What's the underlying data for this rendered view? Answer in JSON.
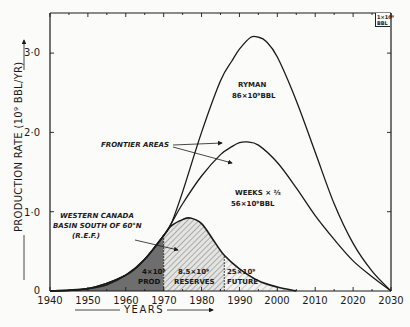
{
  "chart_data": {
    "type": "line",
    "title": "",
    "xlabel": "YEARS",
    "ylabel": "PRODUCTION RATE (10^9 BBL/YR)",
    "xlim": [
      1940,
      2030
    ],
    "ylim": [
      0,
      3.5
    ],
    "grid": false,
    "x_ticks": [
      "1940",
      "1950",
      "1960",
      "1970",
      "1980",
      "1990",
      "2000",
      "2010",
      "2020",
      "2030"
    ],
    "y_ticks": [
      "0",
      "1·0",
      "2·0",
      "3·0"
    ],
    "unit_box": "1×10⁹ BBL",
    "series": [
      {
        "name": "Ryman 86×10⁹ BBL",
        "x": [
          1940,
          1950,
          1960,
          1965,
          1970,
          1972,
          1975,
          1980,
          1985,
          1988,
          1990,
          1993,
          1995,
          1997,
          2000,
          2005,
          2010,
          2015,
          2020,
          2025,
          2030
        ],
        "values": [
          0.0,
          0.03,
          0.2,
          0.4,
          0.7,
          0.85,
          1.25,
          2.0,
          2.65,
          2.9,
          3.05,
          3.2,
          3.2,
          3.15,
          2.95,
          2.4,
          1.75,
          1.1,
          0.6,
          0.25,
          0.0
        ]
      },
      {
        "name": "Weeks × 2/3 56×10⁹ BBL",
        "x": [
          1940,
          1950,
          1960,
          1965,
          1970,
          1972,
          1975,
          1980,
          1985,
          1988,
          1990,
          1992,
          1995,
          2000,
          2005,
          2010,
          2015,
          2020,
          2025,
          2030
        ],
        "values": [
          0.0,
          0.03,
          0.2,
          0.4,
          0.7,
          0.85,
          1.1,
          1.45,
          1.72,
          1.82,
          1.87,
          1.88,
          1.84,
          1.62,
          1.3,
          0.95,
          0.65,
          0.38,
          0.18,
          0.0
        ]
      },
      {
        "name": "Western Canada Basin South of 60°N (R.E.F.)",
        "x": [
          1940,
          1950,
          1955,
          1960,
          1965,
          1970,
          1972,
          1975,
          1977,
          1980,
          1983,
          1986,
          1990,
          1995,
          2000,
          2005
        ],
        "values": [
          0.0,
          0.03,
          0.08,
          0.2,
          0.4,
          0.7,
          0.82,
          0.9,
          0.92,
          0.85,
          0.65,
          0.45,
          0.28,
          0.13,
          0.05,
          0.0
        ]
      }
    ],
    "regions": [
      {
        "label": "4×10⁹ PROD",
        "from": 1940,
        "to": 1970,
        "fill": "dark-grey"
      },
      {
        "label": "8.5×10⁹ RESERVES",
        "from": 1970,
        "to": 1986,
        "fill": "hatched"
      },
      {
        "label": "25×10⁹ FUTURE",
        "from": 1986,
        "to": 2005,
        "fill": "light-hatched"
      }
    ],
    "annotations": [
      {
        "text": "RYMAN",
        "sub": "86×10⁹BBL"
      },
      {
        "text": "FRONTIER AREAS",
        "arrows_to": [
          "Ryman",
          "Weeks"
        ]
      },
      {
        "text": "WEEKS × 2/3",
        "sub": "56×10⁹BBL"
      },
      {
        "text": "WESTERN CANADA BASIN SOUTH OF 60°N (R.E.F.)"
      }
    ]
  },
  "labels": {
    "ryman_title": "RYMAN",
    "ryman_sub": "86×10⁹BBL",
    "frontier": "FRONTIER AREAS",
    "weeks_title": "WEEKS × ⅔",
    "weeks_sub": "56×10⁹BBL",
    "wcb_line1": "WESTERN CANADA",
    "wcb_line2": "BASIN SOUTH OF 60°N",
    "wcb_line3": "(R.E.F.)",
    "prod_amt": "4×10⁹",
    "prod_lbl": "PROD",
    "res_amt": "8.5×10⁹",
    "res_lbl": "RESERVES",
    "fut_amt": "25×10⁹",
    "fut_lbl": "FUTURE",
    "ylabel": "PRODUCTION RATE (10⁹ BBL/YR)",
    "xlabel": "YEARS",
    "unit_line1": "1×10⁹",
    "unit_line2": "BBL"
  },
  "colors": {
    "ink": "#1a1a1a",
    "paper": "#fbfbf9",
    "prod_fill": "#6e6e6e"
  }
}
